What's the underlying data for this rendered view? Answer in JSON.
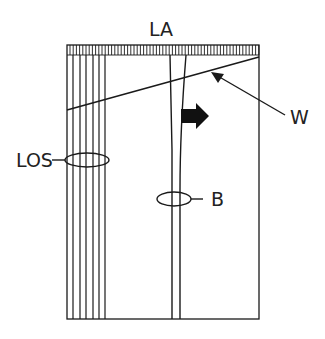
{
  "diagram": {
    "labels": {
      "top": "LA",
      "wall": "W",
      "left_bundle": "LOS",
      "band": "B"
    },
    "colors": {
      "stroke": "#1a1a1a",
      "background": "#ffffff",
      "text": "#222222"
    },
    "elements": {
      "frame": "rectangular enclosure with hatched top bar",
      "top_bar": "hatched strip labelled LA",
      "left_lines": "seven closely spaced parallel vertical lines labelled LOS, encircled by an ellipse",
      "center_channel": "two converging vertical lines forming a narrowing band labelled B, encircled by an ellipse",
      "diagonal": "oblique line crossing the frame, indicated by arrow W",
      "direction_arrow": "bold black block arrow pointing right"
    }
  }
}
